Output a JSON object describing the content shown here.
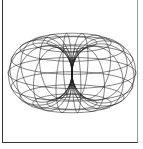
{
  "figure": {
    "caption": "",
    "colors": {
      "line": "#1a1a1a",
      "frame": "#333333",
      "background": "#ffffff"
    }
  },
  "torus": {
    "center": [
      72,
      73
    ],
    "major_radius": 32,
    "minor_radius": 32,
    "meridians": 16,
    "parallels": 14,
    "tilt_deg": 14,
    "rotation_deg": 8,
    "scale": 1.0,
    "stroke_width": 0.55
  }
}
